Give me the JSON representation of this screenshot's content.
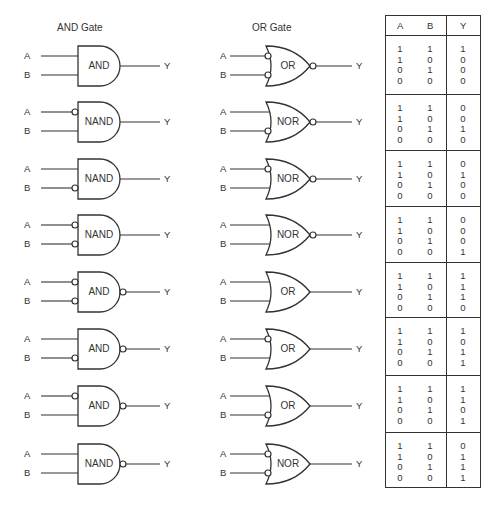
{
  "titles": {
    "and_column": "AND Gate",
    "or_column": "OR Gate"
  },
  "labels": {
    "input_a": "A",
    "input_b": "B",
    "output": "Y"
  },
  "and_column": [
    {
      "name": "AND",
      "bubble_a": false,
      "bubble_b": false,
      "bubble_out": false
    },
    {
      "name": "NAND",
      "bubble_a": true,
      "bubble_b": false,
      "bubble_out": false
    },
    {
      "name": "NAND",
      "bubble_a": false,
      "bubble_b": true,
      "bubble_out": false
    },
    {
      "name": "NAND",
      "bubble_a": true,
      "bubble_b": true,
      "bubble_out": false
    },
    {
      "name": "AND",
      "bubble_a": true,
      "bubble_b": true,
      "bubble_out": true
    },
    {
      "name": "AND",
      "bubble_a": false,
      "bubble_b": true,
      "bubble_out": true
    },
    {
      "name": "AND",
      "bubble_a": true,
      "bubble_b": false,
      "bubble_out": true
    },
    {
      "name": "NAND",
      "bubble_a": false,
      "bubble_b": false,
      "bubble_out": true
    }
  ],
  "or_column": [
    {
      "name": "OR",
      "bubble_a": true,
      "bubble_b": true,
      "bubble_out": true
    },
    {
      "name": "NOR",
      "bubble_a": false,
      "bubble_b": true,
      "bubble_out": true
    },
    {
      "name": "NOR",
      "bubble_a": true,
      "bubble_b": false,
      "bubble_out": true
    },
    {
      "name": "NOR",
      "bubble_a": false,
      "bubble_b": false,
      "bubble_out": true
    },
    {
      "name": "OR",
      "bubble_a": false,
      "bubble_b": false,
      "bubble_out": false
    },
    {
      "name": "OR",
      "bubble_a": true,
      "bubble_b": false,
      "bubble_out": false
    },
    {
      "name": "OR",
      "bubble_a": false,
      "bubble_b": true,
      "bubble_out": false
    },
    {
      "name": "NOR",
      "bubble_a": true,
      "bubble_b": true,
      "bubble_out": false
    }
  ],
  "truth_table": {
    "headers": [
      "A",
      "B",
      "Y"
    ],
    "blocks": [
      {
        "A": [
          "1",
          "1",
          "0",
          "0"
        ],
        "B": [
          "1",
          "0",
          "1",
          "0"
        ],
        "Y": [
          "1",
          "0",
          "0",
          "0"
        ]
      },
      {
        "A": [
          "1",
          "1",
          "0",
          "0"
        ],
        "B": [
          "1",
          "0",
          "1",
          "0"
        ],
        "Y": [
          "0",
          "0",
          "1",
          "0"
        ]
      },
      {
        "A": [
          "1",
          "1",
          "0",
          "0"
        ],
        "B": [
          "1",
          "0",
          "1",
          "0"
        ],
        "Y": [
          "0",
          "1",
          "0",
          "0"
        ]
      },
      {
        "A": [
          "1",
          "1",
          "0",
          "0"
        ],
        "B": [
          "1",
          "0",
          "1",
          "0"
        ],
        "Y": [
          "0",
          "0",
          "0",
          "1"
        ]
      },
      {
        "A": [
          "1",
          "1",
          "0",
          "0"
        ],
        "B": [
          "1",
          "0",
          "1",
          "0"
        ],
        "Y": [
          "1",
          "1",
          "1",
          "0"
        ]
      },
      {
        "A": [
          "1",
          "1",
          "0",
          "0"
        ],
        "B": [
          "1",
          "0",
          "1",
          "0"
        ],
        "Y": [
          "1",
          "0",
          "1",
          "1"
        ]
      },
      {
        "A": [
          "1",
          "1",
          "0",
          "0"
        ],
        "B": [
          "1",
          "0",
          "1",
          "0"
        ],
        "Y": [
          "1",
          "1",
          "0",
          "1"
        ]
      },
      {
        "A": [
          "1",
          "1",
          "0",
          "0"
        ],
        "B": [
          "1",
          "0",
          "1",
          "0"
        ],
        "Y": [
          "0",
          "1",
          "1",
          "1"
        ]
      }
    ]
  }
}
